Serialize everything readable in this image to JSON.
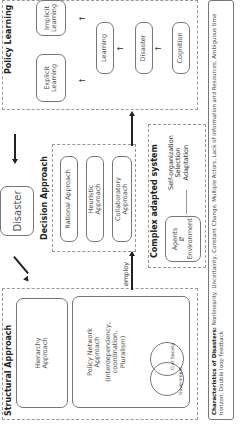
{
  "structural": {
    "title": "Structural Approach",
    "hierarchy": "Hierarchy Approach",
    "policy_network": "Policy Network Approach",
    "policy_network_detail": "(interdependency, coordination, Pluralism)",
    "government": "Government",
    "civil_society": "Civil Society"
  },
  "center": {
    "disaster": "Disaster",
    "employ": "employ"
  },
  "decision": {
    "title": "Decision Approach",
    "items": [
      "Rational Approach",
      "Heuristic Approach",
      "Collaboratory Approach"
    ]
  },
  "complex": {
    "title": "Complex adapted system",
    "agents": "Agents",
    "environment": "Environment",
    "outcomes": [
      "Self-organization",
      "Selection",
      "Adaptation"
    ]
  },
  "policy_learning": {
    "title": "Policy Learning",
    "explicit": "Explicit Learning",
    "implicit": "Implicit Learning",
    "chain": [
      "Cognition",
      "Disaster",
      "Learning"
    ]
  },
  "characteristics": {
    "label": "Characteristics of Disasters:",
    "text": "Nonlinearity, Uncertainty, Constant Change, Multiple Actors, Lack of information and Resources, Ambiguous time horizon, Double loop feedback"
  }
}
